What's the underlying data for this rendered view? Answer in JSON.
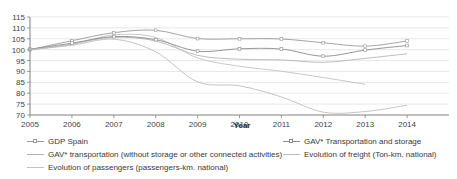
{
  "chart_data": {
    "type": "line",
    "title": "",
    "xlabel": "Year",
    "ylabel": "",
    "grid": true,
    "legend_position": "bottom",
    "xlim": [
      2005,
      2015
    ],
    "ylim": [
      70,
      115
    ],
    "ytick_step": 5,
    "x": [
      2005,
      2006,
      2007,
      2008,
      2009,
      2010,
      2011,
      2012,
      2013,
      2014
    ],
    "xticks": [
      "2005",
      "2006",
      "2007",
      "2008",
      "2009",
      "2010",
      "2011",
      "2012",
      "2013",
      "2014"
    ],
    "yticks": [
      "115",
      "110",
      "105",
      "100",
      "95",
      "90",
      "85",
      "80",
      "75",
      "70"
    ],
    "series": [
      {
        "name": "GDP Spain",
        "color": "#9a9a9a",
        "markers": true,
        "values": [
          100.0,
          104.1,
          107.8,
          108.9,
          105.1,
          105.0,
          104.9,
          103.2,
          101.6,
          104.0
        ]
      },
      {
        "name": "GAV* transportation (without storage or other connected activities)",
        "color": "#b4b4b4",
        "markers": false,
        "values": [
          99.8,
          102.6,
          105.7,
          104.0,
          97.4,
          95.6,
          95.3,
          94.2,
          96.0,
          98.1
        ]
      },
      {
        "name": "Evolution of passengers (passengers-km. national)",
        "color": "#c2c2c2",
        "markers": false,
        "values": [
          100.0,
          102.4,
          106.8,
          105.6,
          96.2,
          92.4,
          90.1,
          87.2,
          84.1,
          null
        ]
      },
      {
        "name": "GAV* Transportation and storage",
        "color": "#8c8c8c",
        "markers": true,
        "values": [
          100.2,
          103.0,
          106.0,
          104.6,
          99.3,
          100.4,
          100.3,
          97.0,
          99.8,
          101.9
        ]
      },
      {
        "name": "Evolution of freight (Ton-km. national)",
        "color": "#bdbdbd",
        "markers": false,
        "values": [
          100.0,
          102.0,
          104.8,
          99.0,
          85.2,
          83.4,
          78.3,
          71.3,
          71.6,
          74.5
        ]
      }
    ]
  },
  "legend": {
    "left_column": [
      "GDP Spain",
      "GAV* transportation (without storage or other connected activities)",
      "Evolution of passengers (passengers-km. national)"
    ],
    "right_column": [
      "GAV* Transportation and storage",
      "Evolution of freight (Ton-km. national)"
    ]
  }
}
